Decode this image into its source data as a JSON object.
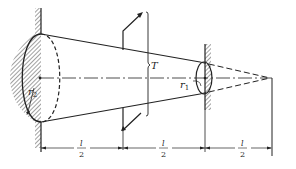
{
  "diagram": {
    "type": "tapered-shaft-torsion",
    "labels": {
      "r2": "r",
      "r2_sub": "2",
      "r1": "r",
      "r1_sub": "1",
      "torque": "T"
    },
    "dimensions": [
      {
        "num": "l",
        "den": "2"
      },
      {
        "num": "l",
        "den": "2"
      },
      {
        "num": "l",
        "den": "2"
      }
    ],
    "colors": {
      "line": "#222222",
      "hatch": "#444444",
      "background": "#ffffff"
    }
  }
}
